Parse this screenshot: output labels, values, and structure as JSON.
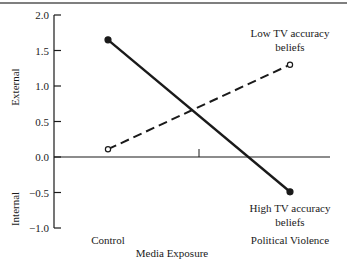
{
  "chart_data": {
    "type": "line",
    "title": "",
    "xlabel": "Media Exposure",
    "ylabel_upper": "External",
    "ylabel_lower": "Internal",
    "categories": [
      "Control",
      "Political Violence"
    ],
    "ylim": [
      -1.0,
      2.0
    ],
    "yticks": [
      "2.0",
      "1.5",
      "1.0",
      "0.5",
      "0.0",
      "−0.5",
      "−1.0"
    ],
    "ytick_values": [
      2.0,
      1.5,
      1.0,
      0.5,
      0.0,
      -0.5,
      -1.0
    ],
    "grid": false,
    "series": [
      {
        "name": "Low TV accuracy beliefs",
        "label_lines": [
          "Low TV accuracy",
          "beliefs"
        ],
        "style": "dashed",
        "marker": "open-circle",
        "values": [
          0.11,
          1.3
        ]
      },
      {
        "name": "High TV accuracy beliefs",
        "label_lines": [
          "High TV accuracy",
          "beliefs"
        ],
        "style": "solid",
        "marker": "filled-circle",
        "values": [
          1.65,
          -0.49
        ]
      }
    ]
  },
  "colors": {
    "ink": "#1a1a1a",
    "background": "#ffffff"
  }
}
